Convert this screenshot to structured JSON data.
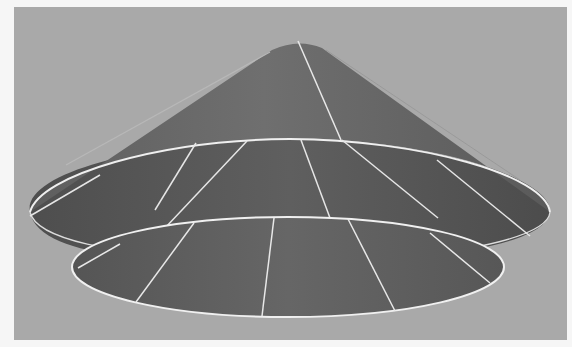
{
  "scene": {
    "description": "3D rendered cone-shaped surface with a flared lower disc, shown with white wireframe edges",
    "background_color": "#a9a9a9",
    "frame_color": "#f6f6f6",
    "surface_color_light": "#6e6e6e",
    "surface_color_dark": "#555555",
    "edge_color": "#f0f0f0"
  },
  "objects": [
    {
      "name": "upper-cone",
      "type": "cone",
      "apex": [
        298,
        41
      ],
      "rim_center": [
        290,
        197
      ],
      "rim_rx": 262,
      "rim_ry": 60
    },
    {
      "name": "lower-disc",
      "type": "ellipse",
      "center": [
        289,
        268
      ],
      "rx": 216,
      "ry": 50
    }
  ]
}
